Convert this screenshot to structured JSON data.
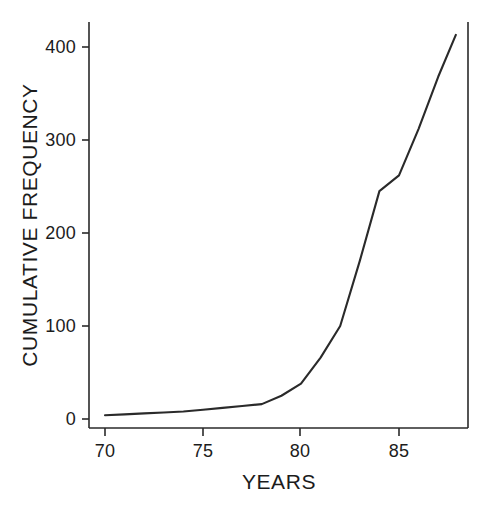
{
  "chart_data": {
    "type": "line",
    "title": "",
    "xlabel": "YEARS",
    "ylabel": "CUMULATIVE FREQUENCY",
    "xlim": [
      69.2,
      88.7
    ],
    "ylim": [
      -8,
      425
    ],
    "grid": false,
    "legend": null,
    "xticks": [
      70,
      75,
      80,
      85
    ],
    "xtick_labels": [
      "70",
      "75",
      "80",
      "85"
    ],
    "yticks": [
      0,
      100,
      200,
      300,
      400
    ],
    "ytick_labels": [
      "0",
      "100",
      "200",
      "300",
      "400"
    ],
    "series": [
      {
        "name": "cumulative frequency",
        "color": "#2a2a2a",
        "x": [
          70.0,
          71.0,
          72.0,
          73.0,
          74.0,
          75.0,
          76.0,
          77.0,
          78.0,
          79.0,
          80.0,
          81.0,
          82.0,
          83.0,
          84.0,
          85.0,
          86.0,
          87.0,
          87.9
        ],
        "values": [
          4,
          5,
          6,
          7,
          8,
          10,
          12,
          14,
          16,
          25,
          38,
          66,
          100,
          170,
          245,
          262,
          312,
          368,
          413
        ]
      }
    ]
  },
  "axes": {
    "x_axis_name": "years-axis",
    "y_axis_name": "cumulative-frequency-axis"
  }
}
